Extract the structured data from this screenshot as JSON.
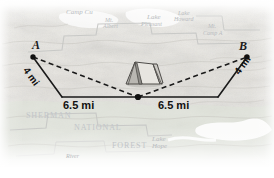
{
  "diagram": {
    "points": [
      {
        "id": "A",
        "label": "A",
        "x": 33,
        "y": 57
      },
      {
        "id": "B",
        "label": "B",
        "x": 247,
        "y": 57
      },
      {
        "id": "C",
        "label": "",
        "x": 138,
        "y": 97
      }
    ],
    "segments": [
      {
        "name": "A-to-corner-left",
        "label": "4 mi",
        "style": "solid"
      },
      {
        "name": "corner-left-to-vertex",
        "label": "6.5 mi",
        "style": "solid"
      },
      {
        "name": "vertex-to-corner-right",
        "label": "6.5 mi",
        "style": "solid"
      },
      {
        "name": "corner-right-to-B",
        "label": "4 mi",
        "style": "solid"
      },
      {
        "name": "A-to-vertex",
        "label": "",
        "style": "dashed"
      },
      {
        "name": "vertex-to-B",
        "label": "",
        "style": "dashed"
      }
    ],
    "labels": {
      "point_a": "A",
      "point_b": "B",
      "left_side": "4 mi",
      "right_side": "4 mi",
      "left_base": "6.5 mi",
      "right_base": "6.5 mi"
    },
    "icon": "tent-icon",
    "colors": {
      "line": "#1a1a1a",
      "map_text": "#b9bcc0",
      "background": "#ffffff"
    }
  },
  "map": {
    "places": [
      {
        "name": "Camp Cu",
        "x": 66,
        "y": 9,
        "size": 7,
        "caps": false
      },
      {
        "name": "Mt.",
        "x": 105,
        "y": 17,
        "size": 6,
        "caps": false
      },
      {
        "name": "Albert",
        "x": 103,
        "y": 23,
        "size": 6,
        "caps": false
      },
      {
        "name": "Lake",
        "x": 147,
        "y": 14,
        "size": 7,
        "caps": false
      },
      {
        "name": "Pleasant",
        "x": 141,
        "y": 21,
        "size": 6,
        "caps": false
      },
      {
        "name": "Lake",
        "x": 178,
        "y": 10,
        "size": 6,
        "caps": false
      },
      {
        "name": "Howard",
        "x": 174,
        "y": 16,
        "size": 6,
        "caps": false
      },
      {
        "name": "Mt.",
        "x": 208,
        "y": 23,
        "size": 6,
        "caps": false
      },
      {
        "name": "Camp A",
        "x": 203,
        "y": 30,
        "size": 6,
        "caps": false
      },
      {
        "name": "SHERMAN",
        "x": 26,
        "y": 112,
        "size": 8,
        "caps": true
      },
      {
        "name": "NATIONAL",
        "x": 74,
        "y": 124,
        "size": 8,
        "caps": true
      },
      {
        "name": "FOREST",
        "x": 112,
        "y": 142,
        "size": 8,
        "caps": true
      },
      {
        "name": "Lake",
        "x": 152,
        "y": 136,
        "size": 7,
        "caps": false
      },
      {
        "name": "Hope",
        "x": 152,
        "y": 143,
        "size": 7,
        "caps": false
      },
      {
        "name": "River",
        "x": 66,
        "y": 153,
        "size": 6,
        "caps": false
      }
    ]
  }
}
